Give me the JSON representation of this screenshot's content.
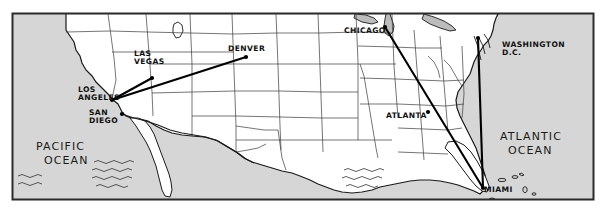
{
  "map": {
    "title": "United States route map",
    "frame": {
      "x": 12,
      "y": 13,
      "width": 582,
      "height": 187,
      "border_color": "#2b2b2b",
      "ocean_fill": "#d6d6d6",
      "land_fill": "#ffffff"
    },
    "cities": [
      {
        "id": "los-angeles",
        "label": "LOS\nANGELES",
        "label_lines": [
          "LOS",
          "ANGELES"
        ],
        "x": 112,
        "y": 100,
        "label_x": 78,
        "label_y": 92,
        "anchor": "start"
      },
      {
        "id": "las-vegas",
        "label": "LAS\nVEGAS",
        "label_lines": [
          "LAS",
          "VEGAS"
        ],
        "x": 152,
        "y": 78,
        "label_x": 134,
        "label_y": 56,
        "anchor": "start"
      },
      {
        "id": "san-diego",
        "label": "SAN\nDIEGO",
        "label_lines": [
          "SAN",
          "DIEGO"
        ],
        "x": 122,
        "y": 114,
        "label_x": 89,
        "label_y": 115,
        "anchor": "start"
      },
      {
        "id": "denver",
        "label": "DENVER",
        "label_lines": [
          "DENVER"
        ],
        "x": 246,
        "y": 57,
        "label_x": 228,
        "label_y": 51,
        "anchor": "start"
      },
      {
        "id": "chicago",
        "label": "CHICAGO",
        "label_lines": [
          "CHICAGO"
        ],
        "x": 385,
        "y": 27,
        "label_x": 344,
        "label_y": 33,
        "anchor": "start"
      },
      {
        "id": "washington-dc",
        "label": "WASHINGTON\nD.C.",
        "label_lines": [
          "WASHINGTON",
          "D.C."
        ],
        "x": 478,
        "y": 38,
        "label_x": 502,
        "label_y": 47,
        "anchor": "start"
      },
      {
        "id": "atlanta",
        "label": "ATLANTA",
        "label_lines": [
          "ATLANTA"
        ],
        "x": 428,
        "y": 112,
        "label_x": 386,
        "label_y": 118,
        "anchor": "start"
      },
      {
        "id": "miami",
        "label": "MIAMI",
        "label_lines": [
          "MIAMI"
        ],
        "x": 483,
        "y": 188,
        "label_x": 484,
        "label_y": 192,
        "anchor": "start"
      }
    ],
    "routes": [
      {
        "id": "route-la-lasvegas",
        "from": "los-angeles",
        "to": "las-vegas"
      },
      {
        "id": "route-la-denver",
        "from": "los-angeles",
        "to": "denver"
      },
      {
        "id": "route-chicago-miami",
        "from": "chicago",
        "to": "miami"
      },
      {
        "id": "route-dc-miami",
        "from": "washington-dc",
        "to": "miami"
      }
    ],
    "ocean_labels": [
      {
        "id": "pacific-ocean",
        "lines": [
          "PACIFIC",
          "OCEAN"
        ],
        "x": 36,
        "y": 150
      },
      {
        "id": "atlantic-ocean",
        "lines": [
          "ATLANTIC",
          "OCEAN"
        ],
        "x": 500,
        "y": 140
      }
    ]
  }
}
